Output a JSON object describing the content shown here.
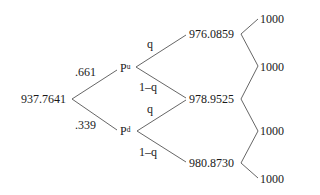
{
  "tree": {
    "root": {
      "value": "937.7641"
    },
    "level1": [
      {
        "node": "P",
        "superscript": "u",
        "edge_prob": ".661"
      },
      {
        "node": "P",
        "superscript": "d",
        "edge_prob": ".339"
      }
    ],
    "level2": [
      {
        "value": "976.0859"
      },
      {
        "value": "978.9525"
      },
      {
        "value": "980.8730"
      }
    ],
    "level2_edges": {
      "pu_up": "q",
      "pu_down": "1–q",
      "pd_up": "q",
      "pd_down": "1–q"
    },
    "leaves": [
      {
        "value": "1000"
      },
      {
        "value": "1000"
      },
      {
        "value": "1000"
      },
      {
        "value": "1000"
      }
    ]
  },
  "colors": {
    "line": "#555555",
    "text": "#1a1a1a",
    "background": "#ffffff"
  }
}
